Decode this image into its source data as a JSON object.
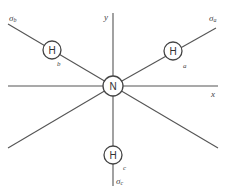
{
  "diagram": {
    "type": "molecular-orbital-geometry",
    "central_atom": {
      "label": "N",
      "x": 113,
      "y": 86
    },
    "axes": {
      "x": {
        "label": "x"
      },
      "y": {
        "label": "y"
      }
    },
    "hydrogens": [
      {
        "id": "a",
        "label": "H",
        "bond_label": "a",
        "orbital_symbol": "σ",
        "orbital_sub": "a"
      },
      {
        "id": "b",
        "label": "H",
        "bond_label": "b",
        "orbital_symbol": "σ",
        "orbital_sub": "b"
      },
      {
        "id": "c",
        "label": "H",
        "bond_label": "c",
        "orbital_symbol": "σ",
        "orbital_sub": "c"
      }
    ],
    "colors": {
      "line": "#555555",
      "text": "#333333",
      "background": "#ffffff"
    }
  }
}
